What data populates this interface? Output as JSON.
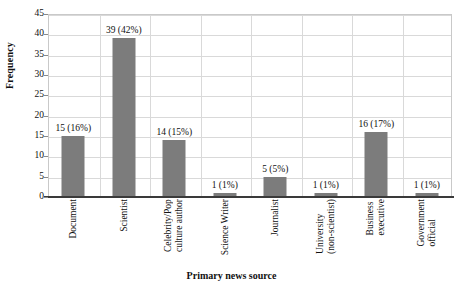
{
  "chart_data": {
    "type": "bar",
    "title": "",
    "xlabel": "Primary news source",
    "ylabel": "Frequency",
    "ylim": [
      0,
      45
    ],
    "ytick_step": 5,
    "yticks": [
      "45",
      "40",
      "35",
      "30",
      "25",
      "20",
      "15",
      "10",
      "5",
      "0"
    ],
    "grid": true,
    "legend": "none",
    "bar_color": "#7c7c7c",
    "categories": [
      "Document",
      "Scientist",
      "Celebrity/Pop culture author",
      "Science Writer",
      "Journalist",
      "University (non-scientist)",
      "Business executive",
      "Government official"
    ],
    "category_lines": [
      [
        "Document"
      ],
      [
        "Scientist"
      ],
      [
        "Celebrity/Pop",
        "culture author"
      ],
      [
        "Science Writer"
      ],
      [
        "Journalist"
      ],
      [
        "University",
        "(non-scientist)"
      ],
      [
        "Business",
        "executive"
      ],
      [
        "Government",
        "official"
      ]
    ],
    "values": [
      15,
      39,
      14,
      1,
      5,
      1,
      16,
      1
    ],
    "percents": [
      "16%",
      "42%",
      "15%",
      "1%",
      "5%",
      "1%",
      "17%",
      "1%"
    ],
    "data_labels": [
      "15 (16%)",
      "39 (42%)",
      "14 (15%)",
      "1 (1%)",
      "5 (5%)",
      "1 (1%)",
      "16 (17%)",
      "1 (1%)"
    ]
  }
}
